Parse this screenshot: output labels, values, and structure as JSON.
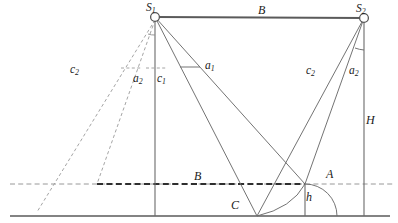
{
  "figure": {
    "type": "geometric-line-diagram",
    "colors": {
      "line": "#555555",
      "dashed": "#8c8c8c",
      "ground": "#595959",
      "text": "#1a1a1a",
      "background": "#ffffff"
    }
  },
  "nodes": [
    {
      "id": "S1",
      "label": "S",
      "sub": "1",
      "x": 155,
      "y": 17,
      "marker": "circle"
    },
    {
      "id": "S2",
      "label": "S",
      "sub": "2",
      "x": 364,
      "y": 18,
      "marker": "circle"
    },
    {
      "id": "C",
      "label": "C",
      "sub": "",
      "x": 257,
      "y": 216,
      "marker": "none"
    },
    {
      "id": "A",
      "label": "A",
      "sub": "",
      "x": 305,
      "y": 184,
      "marker": "none"
    }
  ],
  "labels": [
    {
      "name": "baseline-top-label",
      "text": "B",
      "sub": "",
      "x": 258,
      "y": 6,
      "size": "f12"
    },
    {
      "name": "node-s1-label",
      "text": "S",
      "sub": "1",
      "x": 147,
      "y": 3,
      "size": "f11"
    },
    {
      "name": "node-s2-label",
      "text": "S",
      "sub": "2",
      "x": 357,
      "y": 4,
      "size": "f11"
    },
    {
      "name": "c2-left-label",
      "text": "c",
      "sub": "2",
      "x": 71,
      "y": 65,
      "size": "f11"
    },
    {
      "name": "a2-left-label",
      "text": "a",
      "sub": "2",
      "x": 134,
      "y": 74,
      "size": "f11"
    },
    {
      "name": "c1-label",
      "text": "c",
      "sub": "1",
      "x": 157,
      "y": 74,
      "size": "f11"
    },
    {
      "name": "a1-label",
      "text": "a",
      "sub": "1",
      "x": 205,
      "y": 62,
      "size": "f11"
    },
    {
      "name": "c2-right-label",
      "text": "c",
      "sub": "2",
      "x": 306,
      "y": 66,
      "size": "f11"
    },
    {
      "name": "a2-right-label",
      "text": "a",
      "sub": "2",
      "x": 349,
      "y": 66,
      "size": "f11"
    },
    {
      "name": "height-label",
      "text": "H",
      "sub": "",
      "x": 366,
      "y": 115,
      "size": "f12"
    },
    {
      "name": "baseline-lower-label",
      "text": "B",
      "sub": "",
      "x": 194,
      "y": 172,
      "size": "f12"
    },
    {
      "name": "point-a-label",
      "text": "A",
      "sub": "",
      "x": 326,
      "y": 170,
      "size": "f12"
    },
    {
      "name": "point-c-label",
      "text": "C",
      "sub": "",
      "x": 231,
      "y": 200,
      "size": "f12"
    },
    {
      "name": "h-label",
      "text": "h",
      "sub": "",
      "x": 305,
      "y": 192,
      "size": "f12"
    }
  ],
  "geometry": {
    "ground_line": {
      "x1": 10,
      "y1": 216,
      "x2": 390,
      "y2": 216
    },
    "baseline_top": {
      "x1": 155,
      "y1": 17,
      "x2": 364,
      "y2": 18
    },
    "dashed_horizontal": {
      "x1": 10,
      "y1": 184,
      "x2": 392,
      "y2": 184
    },
    "dashed_thick_B": {
      "x1": 97,
      "y1": 184,
      "x2": 305,
      "y2": 184
    },
    "vertical_s1": {
      "x1": 155,
      "y1": 17,
      "x2": 155,
      "y2": 216
    },
    "vertical_s2": {
      "x1": 364,
      "y1": 18,
      "x2": 364,
      "y2": 216
    },
    "vertical_a": {
      "x1": 305,
      "y1": 184,
      "x2": 305,
      "y2": 216
    },
    "rays_from_s1": [
      {
        "name": "s1-to-c",
        "x2": 257,
        "y2": 216
      },
      {
        "name": "s1-to-a",
        "x2": 305,
        "y2": 184
      }
    ],
    "rays_from_s2": [
      {
        "name": "s2-to-c",
        "x2": 257,
        "y2": 216
      },
      {
        "name": "s2-to-a",
        "x2": 305,
        "y2": 184
      }
    ],
    "dashed_rays_from_s1": [
      {
        "name": "s1-dashed-far",
        "x2": 37,
        "y2": 212
      },
      {
        "name": "s1-dashed-near",
        "x2": 97,
        "y2": 184
      }
    ],
    "tick_marks": [
      {
        "name": "tick-a2-left",
        "x1": 124,
        "y1": 68,
        "x2": 142,
        "y2": 68
      },
      {
        "name": "tick-c1",
        "x1": 146,
        "y1": 68,
        "x2": 164,
        "y2": 68
      },
      {
        "name": "tick-a1",
        "x1": 179,
        "y1": 68,
        "x2": 199,
        "y2": 68
      }
    ],
    "angle_arcs": [
      {
        "name": "arc-at-s1",
        "cx": 155,
        "cy": 17,
        "r": 14
      },
      {
        "name": "arc-at-s2",
        "cx": 364,
        "cy": 18,
        "r": 22
      },
      {
        "name": "arc-at-c",
        "cx": 257,
        "cy": 216,
        "r": 50
      },
      {
        "name": "arc-at-a",
        "cx": 305,
        "cy": 184,
        "r": 32
      }
    ]
  }
}
